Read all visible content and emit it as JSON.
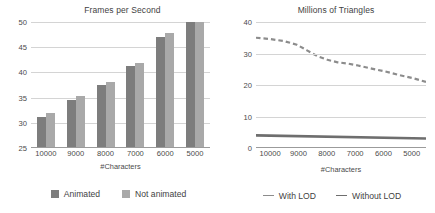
{
  "colors": {
    "series_animated": "#7d7d7d",
    "series_not_animated": "#a9a9a9",
    "series_with_lod": "#8c8c8c",
    "series_without_lod": "#6e6e6e",
    "gridline": "#d4d4d4",
    "axis": "#9b9b9b",
    "text": "#3f3f3f"
  },
  "left_panel": {
    "title": "Frames per Second",
    "xlabel": "#Characters",
    "yticks": [
      "50",
      "45",
      "40",
      "35",
      "30",
      "25"
    ],
    "xticks": [
      "10000",
      "9000",
      "8000",
      "7000",
      "6000",
      "5000"
    ],
    "legend": [
      {
        "label": "Animated",
        "marker": "square-swatch"
      },
      {
        "label": "Not animated",
        "marker": "square-swatch"
      }
    ]
  },
  "right_panel": {
    "title": "Millions of Triangles",
    "xlabel": "#Characters",
    "yticks": [
      "40",
      "30",
      "20",
      "10",
      "0"
    ],
    "xticks": [
      "10000",
      "9000",
      "8000",
      "7000",
      "6000",
      "5000"
    ],
    "legend": [
      {
        "label": "With LOD",
        "marker": "dashed-line"
      },
      {
        "label": "Without LOD",
        "marker": "solid-line"
      }
    ]
  },
  "chart_data": [
    {
      "type": "bar",
      "title": "Frames per Second",
      "xlabel": "#Characters",
      "ylabel": "",
      "categories": [
        "10000",
        "9000",
        "8000",
        "7000",
        "6000",
        "5000"
      ],
      "ylim": [
        25,
        50
      ],
      "yticks": [
        25,
        30,
        35,
        40,
        45,
        50
      ],
      "grid": true,
      "legend_position": "bottom",
      "series": [
        {
          "name": "Animated",
          "color": "#7d7d7d",
          "values": [
            31.0,
            34.5,
            37.4,
            41.2,
            47.0,
            50.0
          ]
        },
        {
          "name": "Not animated",
          "color": "#a9a9a9",
          "values": [
            31.8,
            35.2,
            38.0,
            41.9,
            47.9,
            50.0
          ]
        }
      ]
    },
    {
      "type": "line",
      "title": "Millions of Triangles",
      "xlabel": "#Characters",
      "ylabel": "",
      "x": [
        10000,
        9000,
        8000,
        7000,
        6000,
        5000
      ],
      "xticks": [
        10000,
        9000,
        8000,
        7000,
        6000,
        5000
      ],
      "ylim": [
        0,
        40
      ],
      "yticks": [
        0,
        10,
        20,
        30,
        40
      ],
      "grid": true,
      "legend_position": "bottom",
      "series": [
        {
          "name": "With LOD",
          "color": "#8c8c8c",
          "style": "dashed",
          "x": [
            10000,
            9600,
            9200,
            8800,
            8500,
            8200,
            7900,
            7600,
            7300,
            7000,
            6600,
            6200,
            5800,
            5400,
            5000
          ],
          "values": [
            35.0,
            34.6,
            34.0,
            32.8,
            31.0,
            29.2,
            28.0,
            27.2,
            26.8,
            26.2,
            25.2,
            24.3,
            23.2,
            22.2,
            21.0
          ]
        },
        {
          "name": "Without LOD",
          "color": "#6e6e6e",
          "style": "solid",
          "x": [
            10000,
            5000
          ],
          "values": [
            4.0,
            3.0
          ]
        }
      ]
    }
  ]
}
